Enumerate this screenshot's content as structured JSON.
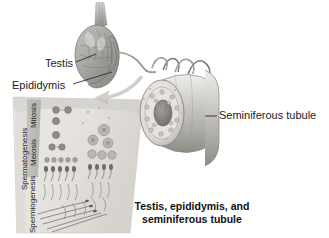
{
  "figure": {
    "title": "Testis, epididymis, and seminiferous tubule",
    "caption_line_1": "Testis, epididymis, and",
    "caption_line_2": "seminiferous tubule",
    "background_color": "#ffffff",
    "style": "grayscale anatomical illustration"
  },
  "callouts": {
    "testis": "Testis",
    "epididymis": "Epididymis",
    "seminiferous_tubule": "Seminiferous tubule"
  },
  "panel": {
    "name": "spermatogenesis-panel",
    "vertical_labels": {
      "spermatogenesis": "Spermatogenesis",
      "spermiogenesis": "Spermiogenesis",
      "meiosis": "Meiosis",
      "mitosis": "Mitosis"
    },
    "band_color": "#b9b9b9",
    "panel_color": "#e8e6e2"
  },
  "colors": {
    "text": "#1b1b1b",
    "caption": "#121212",
    "leader_line": "#333333",
    "organ_fill": "#b0aeab",
    "organ_shadow": "#8a8884",
    "tubule_fill": "#dedbd6",
    "lumen": "#8f8d8a",
    "arrow": "#c9c7c3"
  }
}
